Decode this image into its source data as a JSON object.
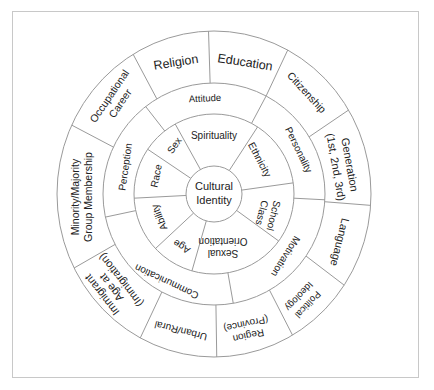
{
  "diagram": {
    "title": "Cultural Identity",
    "center": {
      "label_line1": "Cultural",
      "label_line2": "Identity"
    },
    "inner_ring": [
      {
        "label": "Spirituality"
      },
      {
        "label": "Ethnicity"
      },
      {
        "label_line1": "School",
        "label_line2": "Class"
      },
      {
        "label_line1": "Sexual",
        "label_line2": "Orientation"
      },
      {
        "label": "Age"
      },
      {
        "label": "Ability"
      },
      {
        "label": "Race"
      },
      {
        "label": "Sex"
      }
    ],
    "middle_ring": [
      {
        "label": "Attitude"
      },
      {
        "label": "Personality"
      },
      {
        "label": "Motivation"
      },
      {
        "label": "Communication"
      },
      {
        "label": "Perception"
      }
    ],
    "outer_ring": [
      {
        "label": "Religion"
      },
      {
        "label": "Education"
      },
      {
        "label": "Citizenship"
      },
      {
        "label_line1": "Generation",
        "label_line2": "(1st, 2nd, 3rd)"
      },
      {
        "label": "Language"
      },
      {
        "label_line1": "Political",
        "label_line2": "Ideology"
      },
      {
        "label_line1": "Region",
        "label_line2": "(Province)"
      },
      {
        "label": "Urban/Rural"
      },
      {
        "label_line1": "Immigrant",
        "label_line2": "Age at",
        "label_line3": "(Immigration)"
      },
      {
        "label_line1": "Minority/Majority",
        "label_line2": "Group Membership"
      },
      {
        "label_line1": "Occupational",
        "label_line2": "Career"
      }
    ],
    "colors": {
      "line": "#9a9a9a",
      "text": "#222222",
      "frame": "#c8c8c8",
      "background": "#ffffff"
    }
  }
}
